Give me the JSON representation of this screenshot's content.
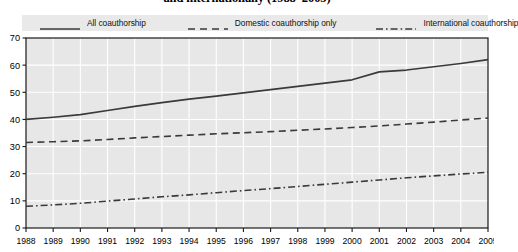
{
  "chart_data": {
    "type": "line",
    "title": "and internationally (1988–2005)",
    "xlabel": "",
    "ylabel": "",
    "x": [
      1988,
      1989,
      1990,
      1991,
      1992,
      1993,
      1994,
      1995,
      1996,
      1997,
      1998,
      1999,
      2000,
      2001,
      2002,
      2003,
      2004,
      2005
    ],
    "categories": [
      "1988",
      "1989",
      "1990",
      "1991",
      "1992",
      "1993",
      "1994",
      "1995",
      "1996",
      "1997",
      "1998",
      "1999",
      "2000",
      "2001",
      "2002",
      "2003",
      "2004",
      "2005"
    ],
    "ylim": [
      0,
      70
    ],
    "yticks": [
      0,
      10,
      20,
      30,
      40,
      50,
      60,
      70
    ],
    "ytick_labels": [
      "0",
      "10",
      "20",
      "30",
      "40",
      "50",
      "60",
      "70"
    ],
    "grid": true,
    "legend_position": "top",
    "series": [
      {
        "name": "All coauthorship",
        "style": "solid",
        "color": "#3a3a3a",
        "values": [
          40.0,
          40.8,
          41.8,
          43.3,
          44.8,
          46.2,
          47.5,
          48.6,
          49.8,
          51.0,
          52.2,
          53.4,
          54.6,
          57.5,
          58.2,
          59.4,
          60.6,
          62.0
        ]
      },
      {
        "name": "Domestic coauthorship only",
        "style": "dashed",
        "color": "#3a3a3a",
        "values": [
          31.5,
          31.8,
          32.1,
          32.6,
          33.2,
          33.7,
          34.2,
          34.7,
          35.1,
          35.5,
          36.0,
          36.5,
          37.0,
          37.6,
          38.3,
          39.0,
          39.8,
          40.5
        ]
      },
      {
        "name": "International coauthorship",
        "style": "dashdot",
        "color": "#3a3a3a",
        "values": [
          8.0,
          8.5,
          9.1,
          9.9,
          10.7,
          11.5,
          12.2,
          13.0,
          13.8,
          14.5,
          15.3,
          16.1,
          16.9,
          17.7,
          18.5,
          19.2,
          19.9,
          20.5
        ]
      }
    ]
  },
  "legend": {
    "items": [
      {
        "label": "All coauthorship",
        "style": "solid"
      },
      {
        "label": "Domestic coauthorship only",
        "style": "dashed"
      },
      {
        "label": "International coauthorship",
        "style": "dashdot"
      }
    ]
  },
  "colors": {
    "plot_background": "#e7e7e7",
    "legend_background": "#e9e9e9",
    "gridline": "#ffffff",
    "axis": "#1a1a1a",
    "line": "#3a3a3a"
  }
}
